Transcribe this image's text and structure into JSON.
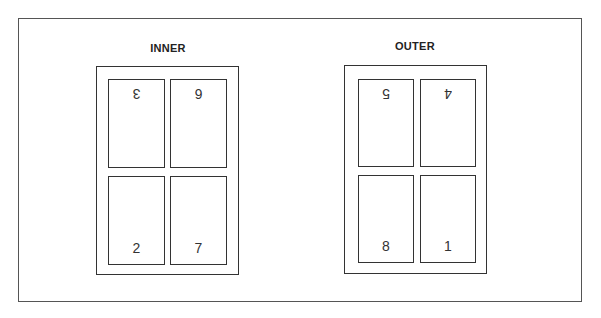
{
  "diagrams": [
    {
      "title": "INNER",
      "panels": [
        {
          "number": "3",
          "inverted": true
        },
        {
          "number": "6",
          "inverted": true
        },
        {
          "number": "2",
          "inverted": false
        },
        {
          "number": "7",
          "inverted": false
        }
      ]
    },
    {
      "title": "OUTER",
      "panels": [
        {
          "number": "5",
          "inverted": true
        },
        {
          "number": "4",
          "inverted": true
        },
        {
          "number": "8",
          "inverted": false
        },
        {
          "number": "1",
          "inverted": false
        }
      ]
    }
  ],
  "colors": {
    "stroke": "#333333",
    "frame": "#555555",
    "background": "#ffffff"
  }
}
